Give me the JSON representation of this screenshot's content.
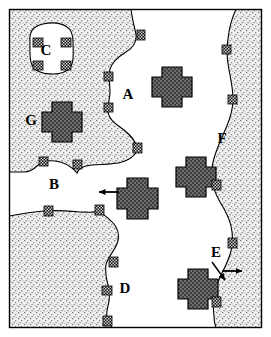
{
  "figure": {
    "width": 271,
    "height": 337,
    "background_color": "#ffffff",
    "frame_color": "#000000",
    "stipple_color": "#e8e8e8",
    "stipple_dot_color": "#6a6a6a",
    "cross_fill_color": "#595959",
    "cross_outline_color": "#000000",
    "marker_color": "#1a1a1a",
    "arrow_color": "#000000"
  },
  "labels": [
    {
      "id": "A",
      "text": "A",
      "x": 128,
      "y": 99,
      "note": "white domain, upper centre-left"
    },
    {
      "id": "B",
      "text": "B",
      "x": 54,
      "y": 189,
      "note": "white domain, middle left"
    },
    {
      "id": "C",
      "text": "C",
      "x": 46,
      "y": 55,
      "note": "white inclusion inside upper-left stipple"
    },
    {
      "id": "D",
      "text": "D",
      "x": 125,
      "y": 293,
      "note": "white domain, lower centre"
    },
    {
      "id": "E",
      "text": "E",
      "x": 216,
      "y": 257,
      "note": "white domain, lower right near arrows"
    },
    {
      "id": "F",
      "text": "F",
      "x": 222,
      "y": 143,
      "note": "white domain, right of centre"
    },
    {
      "id": "G",
      "text": "G",
      "x": 31,
      "y": 125,
      "note": "label left of cross in upper-left stipple"
    }
  ],
  "crosses": [
    {
      "id": "cross-a",
      "cx": 172,
      "cy": 82,
      "size": 30,
      "note": "in domain A"
    },
    {
      "id": "cross-g",
      "cx": 62,
      "cy": 117,
      "size": 30,
      "note": "next to label G"
    },
    {
      "id": "cross-b",
      "cx": 137,
      "cy": 193,
      "size": 31,
      "note": "target of left-pointing arrow"
    },
    {
      "id": "cross-f",
      "cx": 196,
      "cy": 172,
      "size": 30,
      "note": "in domain F"
    },
    {
      "id": "cross-e",
      "cx": 198,
      "cy": 284,
      "size": 30,
      "note": "in domain E"
    }
  ],
  "arrows": [
    {
      "id": "arrow-to-cross-b",
      "x1": 119,
      "y1": 192,
      "x2": 98,
      "y2": 192,
      "direction": "left"
    },
    {
      "id": "arrow-e-diagonal",
      "x1": 212,
      "y1": 263,
      "x2": 226,
      "y2": 281,
      "direction": "down-right"
    },
    {
      "id": "arrow-e-horizontal",
      "x1": 223,
      "y1": 271,
      "x2": 243,
      "y2": 271,
      "direction": "right"
    }
  ],
  "markers": [
    {
      "id": "m01",
      "x": 137,
      "y": 30,
      "w": 8,
      "h": 10
    },
    {
      "id": "m02",
      "x": 104,
      "y": 72,
      "w": 9,
      "h": 9
    },
    {
      "id": "m03",
      "x": 104,
      "y": 103,
      "w": 9,
      "h": 9
    },
    {
      "id": "m04",
      "x": 133,
      "y": 143,
      "w": 9,
      "h": 10
    },
    {
      "id": "m05",
      "x": 39,
      "y": 157,
      "w": 9,
      "h": 9
    },
    {
      "id": "m06",
      "x": 73,
      "y": 160,
      "w": 9,
      "h": 9
    },
    {
      "id": "m07",
      "x": 44,
      "y": 206,
      "w": 9,
      "h": 10
    },
    {
      "id": "m08",
      "x": 95,
      "y": 205,
      "w": 9,
      "h": 10
    },
    {
      "id": "m09",
      "x": 109,
      "y": 257,
      "w": 9,
      "h": 10
    },
    {
      "id": "m10",
      "x": 102,
      "y": 286,
      "w": 10,
      "h": 9
    },
    {
      "id": "m11",
      "x": 103,
      "y": 316,
      "w": 9,
      "h": 10
    },
    {
      "id": "m12",
      "x": 222,
      "y": 45,
      "w": 9,
      "h": 9
    },
    {
      "id": "m13",
      "x": 228,
      "y": 95,
      "w": 9,
      "h": 9
    },
    {
      "id": "m14",
      "x": 212,
      "y": 180,
      "w": 9,
      "h": 10
    },
    {
      "id": "m15",
      "x": 228,
      "y": 238,
      "w": 9,
      "h": 10
    },
    {
      "id": "m16",
      "x": 212,
      "y": 297,
      "w": 9,
      "h": 10
    },
    {
      "id": "m17",
      "x": 33,
      "y": 38,
      "w": 10,
      "h": 9
    },
    {
      "id": "m18",
      "x": 61,
      "y": 38,
      "w": 10,
      "h": 9
    },
    {
      "id": "m19",
      "x": 33,
      "y": 61,
      "w": 10,
      "h": 9
    },
    {
      "id": "m20",
      "x": 61,
      "y": 61,
      "w": 10,
      "h": 9
    }
  ]
}
